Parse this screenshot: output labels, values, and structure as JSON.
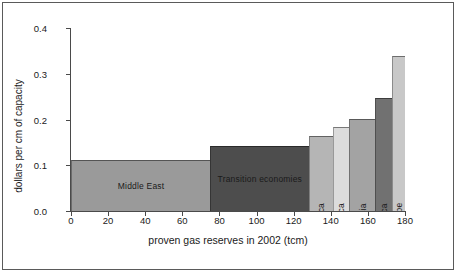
{
  "chart_data": {
    "type": "bar",
    "title": "",
    "subtitle": "",
    "xlabel": "proven gas reserves in 2002 (tcm)",
    "ylabel": "dollars per cm of capacity",
    "xlim": [
      0,
      180
    ],
    "ylim": [
      0.0,
      0.4
    ],
    "xticks": [
      0,
      20,
      40,
      60,
      80,
      100,
      120,
      140,
      160,
      180
    ],
    "xtick_labels": [
      "0",
      "20",
      "40",
      "60",
      "80",
      "100",
      "120",
      "140",
      "160",
      "180"
    ],
    "yticks": [
      0.0,
      0.1,
      0.2,
      0.3,
      0.4
    ],
    "ytick_labels": [
      "0.0",
      "0.1",
      "0.2",
      "0.3",
      "0.4"
    ],
    "grid": false,
    "legend": "none",
    "variable_width_bars": true,
    "categories": [
      "Middle East",
      "Transition economies",
      "Africa",
      "Latin America",
      "Asia",
      "OECD North America",
      "OECD Europe"
    ],
    "values": [
      0.112,
      0.143,
      0.163,
      0.183,
      0.202,
      0.247,
      0.339
    ],
    "bars": [
      {
        "label": "Middle East",
        "x_start": 0,
        "x_end": 75,
        "width": 75,
        "value": 0.112,
        "color": "#9a9a9a",
        "label_orientation": "horizontal"
      },
      {
        "label": "Transition economies",
        "x_start": 75,
        "x_end": 128,
        "width": 53,
        "value": 0.143,
        "color": "#4d4d4d",
        "label_orientation": "horizontal"
      },
      {
        "label": "Africa",
        "x_start": 128,
        "x_end": 141,
        "width": 13,
        "value": 0.163,
        "color": "#b5b5b5",
        "label_orientation": "vertical"
      },
      {
        "label": "Latin America",
        "x_start": 141,
        "x_end": 150,
        "width": 9,
        "value": 0.183,
        "color": "#dcdcdc",
        "label_orientation": "vertical"
      },
      {
        "label": "Asia",
        "x_start": 150,
        "x_end": 164,
        "width": 14,
        "value": 0.202,
        "color": "#a3a3a3",
        "label_orientation": "vertical"
      },
      {
        "label": "OECD North America",
        "x_start": 164,
        "x_end": 173,
        "width": 9,
        "value": 0.247,
        "color": "#717171",
        "label_orientation": "vertical"
      },
      {
        "label": "OECD Europe",
        "x_start": 173,
        "x_end": 180,
        "width": 7,
        "value": 0.339,
        "color": "#c8c8c8",
        "label_orientation": "vertical"
      }
    ]
  }
}
